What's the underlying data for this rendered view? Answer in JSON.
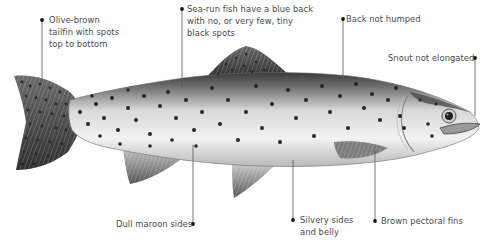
{
  "diagram": {
    "background_color": "#ffffff",
    "text_color": "#4a4a4a",
    "leader_color": "#555555",
    "callouts": [
      {
        "id": "tailfin",
        "lines": [
          "Olive-brown",
          "tailfin with spots",
          "top to bottom"
        ]
      },
      {
        "id": "sea-run",
        "lines": [
          "Sea-run fish have a blue back",
          "with no, or very few, tiny",
          "black spots"
        ]
      },
      {
        "id": "back",
        "lines": [
          "Back not humped"
        ]
      },
      {
        "id": "snout",
        "lines": [
          "Snout not elongated"
        ]
      },
      {
        "id": "sides",
        "lines": [
          "Dull maroon sides"
        ]
      },
      {
        "id": "belly",
        "lines": [
          "Silvery sides",
          "and belly"
        ]
      },
      {
        "id": "pectoral",
        "lines": [
          "Brown pectoral fins"
        ]
      }
    ]
  }
}
